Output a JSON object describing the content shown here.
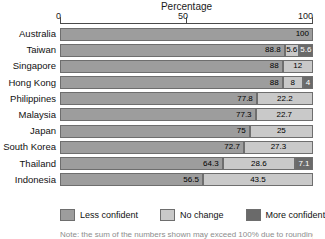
{
  "chart_data": {
    "type": "bar",
    "title": "Percentage",
    "subtitle": "",
    "xlabel": "Percentage",
    "ylabel": "",
    "orientation": "horizontal",
    "stacked": true,
    "stack_mode": "percent",
    "grid": false,
    "legend_position": "bottom",
    "xlim": [
      0,
      100
    ],
    "xticks": [
      0,
      50,
      100
    ],
    "xtick_labels": [
      "0",
      "50",
      "100"
    ],
    "categories": [
      "Australia",
      "Taiwan",
      "Singapore",
      "Hong Kong",
      "Philippines",
      "Malaysia",
      "Japan",
      "South Korea",
      "Thailand",
      "Indonesia"
    ],
    "series": [
      {
        "name": "Less confident",
        "color": "#9d9d9d",
        "values": [
          100,
          88.8,
          88,
          88,
          77.8,
          77.3,
          75,
          72.7,
          64.3,
          56.5
        ]
      },
      {
        "name": "No change",
        "color": "#c9c9c9",
        "values": [
          0,
          5.6,
          12,
          8,
          22.2,
          22.7,
          25,
          27.3,
          28.6,
          43.5
        ]
      },
      {
        "name": "More confident",
        "color": "#6a6a6a",
        "values": [
          0,
          5.6,
          0,
          4,
          0,
          0,
          0,
          0,
          7.1,
          0
        ]
      }
    ],
    "rows": [
      {
        "label": "Australia",
        "segments": [
          {
            "series": "Less confident",
            "value": 100,
            "label": "100"
          }
        ]
      },
      {
        "label": "Taiwan",
        "segments": [
          {
            "series": "Less confident",
            "value": 88.8,
            "label": "88.8"
          },
          {
            "series": "No change",
            "value": 5.6,
            "label": "5.6"
          },
          {
            "series": "More confident",
            "value": 5.6,
            "label": "5.6"
          }
        ]
      },
      {
        "label": "Singapore",
        "segments": [
          {
            "series": "Less confident",
            "value": 88,
            "label": "88"
          },
          {
            "series": "No change",
            "value": 12,
            "label": "12"
          }
        ]
      },
      {
        "label": "Hong Kong",
        "segments": [
          {
            "series": "Less confident",
            "value": 88,
            "label": "88"
          },
          {
            "series": "No change",
            "value": 8,
            "label": "8"
          },
          {
            "series": "More confident",
            "value": 4,
            "label": "4"
          }
        ]
      },
      {
        "label": "Philippines",
        "segments": [
          {
            "series": "Less confident",
            "value": 77.8,
            "label": "77.8"
          },
          {
            "series": "No change",
            "value": 22.2,
            "label": "22.2"
          }
        ]
      },
      {
        "label": "Malaysia",
        "segments": [
          {
            "series": "Less confident",
            "value": 77.3,
            "label": "77.3"
          },
          {
            "series": "No change",
            "value": 22.7,
            "label": "22.7"
          }
        ]
      },
      {
        "label": "Japan",
        "segments": [
          {
            "series": "Less confident",
            "value": 75,
            "label": "75"
          },
          {
            "series": "No change",
            "value": 25,
            "label": "25"
          }
        ]
      },
      {
        "label": "South Korea",
        "segments": [
          {
            "series": "Less confident",
            "value": 72.7,
            "label": "72.7"
          },
          {
            "series": "No change",
            "value": 27.3,
            "label": "27.3"
          }
        ]
      },
      {
        "label": "Thailand",
        "segments": [
          {
            "series": "Less confident",
            "value": 64.3,
            "label": "64.3"
          },
          {
            "series": "No change",
            "value": 28.6,
            "label": "28.6"
          },
          {
            "series": "More confident",
            "value": 7.1,
            "label": "7.1"
          }
        ]
      },
      {
        "label": "Indonesia",
        "segments": [
          {
            "series": "Less confident",
            "value": 56.5,
            "label": "56.5"
          },
          {
            "series": "No change",
            "value": 43.5,
            "label": "43.5"
          }
        ]
      }
    ],
    "legend": [
      {
        "label": "Less confident",
        "color": "#9d9d9d"
      },
      {
        "label": "No change",
        "color": "#c9c9c9"
      },
      {
        "label": "More confident",
        "color": "#6a6a6a"
      }
    ]
  },
  "axis": {
    "title": "Percentage",
    "tick_0": "0",
    "tick_50": "50",
    "tick_100": "100"
  },
  "footnote": {
    "text": "Note: the sum of the numbers shown may exceed 100% due to rounding"
  }
}
